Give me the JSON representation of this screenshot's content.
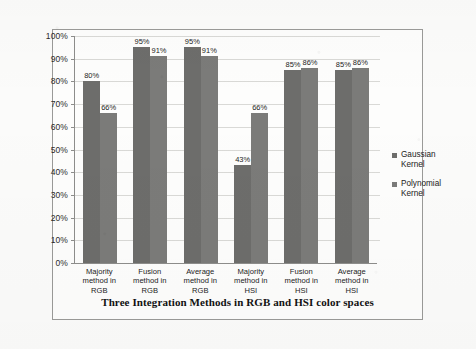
{
  "chart_data": {
    "type": "bar",
    "title": "",
    "subtitle": "",
    "xlabel": "Three Integration Methods in RGB and HSI color spaces",
    "ylabel": "Exprimental precision rate",
    "categories": [
      "Majority method in RGB",
      "Fusion method in RGB",
      "Average method in RGB",
      "Majority method in HSI",
      "Fusion method in HSI",
      "Average method in HSI"
    ],
    "category_lines": [
      [
        "Majority",
        "method in",
        "RGB"
      ],
      [
        "Fusion",
        "method in",
        "RGB"
      ],
      [
        "Average",
        "method in",
        "RGB"
      ],
      [
        "Majority",
        "method in",
        "HSI"
      ],
      [
        "Fusion",
        "method in",
        "HSI"
      ],
      [
        "Average",
        "method in",
        "HSI"
      ]
    ],
    "series": [
      {
        "name": "Gaussian Kernel",
        "color": "#6d6d6b",
        "values": [
          80,
          95,
          95,
          43,
          85,
          85
        ],
        "value_labels": [
          "80%",
          "95%",
          "95%",
          "43%",
          "85%",
          "85%"
        ]
      },
      {
        "name": "Polynomial Kernel",
        "color": "#7b7b79",
        "values": [
          66,
          91,
          91,
          66,
          86,
          86
        ],
        "value_labels": [
          "66%",
          "91%",
          "91%",
          "66%",
          "86%",
          "86%"
        ]
      }
    ],
    "ylim": [
      0,
      100
    ],
    "ytick_step": 10,
    "ytick_labels": [
      "100%",
      "90%",
      "80%",
      "70%",
      "60%",
      "50%",
      "40%",
      "30%",
      "20%",
      "10%",
      "0%"
    ],
    "ytick_values": [
      100,
      90,
      80,
      70,
      60,
      50,
      40,
      30,
      20,
      10,
      0
    ],
    "grid": true,
    "legend_position": "right",
    "legend": [
      {
        "label_line1": "Gaussian",
        "label_line2": "Kernel"
      },
      {
        "label_line1": "Polynomial",
        "label_line2": "Kernel"
      }
    ]
  }
}
